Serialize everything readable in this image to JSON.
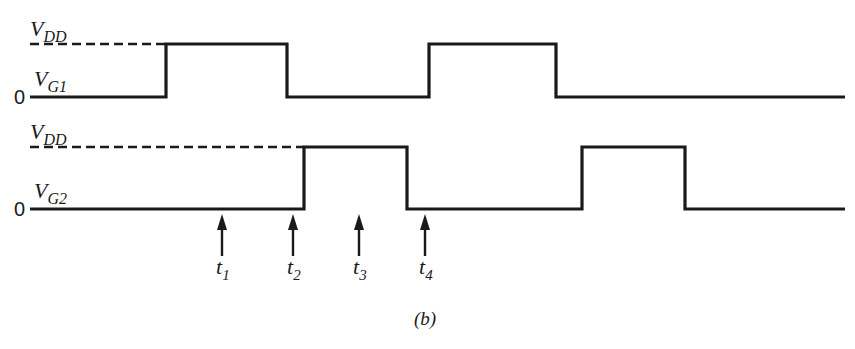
{
  "figure": {
    "caption": "(b)",
    "ink_color": "#1a1a1a",
    "background": "#ffffff"
  },
  "signals": [
    {
      "id": "vg1",
      "label_main": "V",
      "label_sub": "G1",
      "high_label_main": "V",
      "high_label_sub": "DD",
      "zero_label": "0",
      "high_y": 44,
      "low_y": 97,
      "x_start": 30,
      "x_end": 845,
      "dash_end": 166,
      "pulses": [
        [
          166,
          287
        ],
        [
          429,
          556
        ]
      ]
    },
    {
      "id": "vg2",
      "label_main": "V",
      "label_sub": "G2",
      "high_label_main": "V",
      "high_label_sub": "DD",
      "zero_label": "0",
      "high_y": 147,
      "low_y": 209,
      "x_start": 30,
      "x_end": 845,
      "dash_end": 304,
      "pulses": [
        [
          304,
          407
        ],
        [
          582,
          685
        ]
      ]
    }
  ],
  "time_markers": [
    {
      "label_main": "t",
      "label_sub": "1",
      "x": 222
    },
    {
      "label_main": "t",
      "label_sub": "2",
      "x": 293
    },
    {
      "label_main": "t",
      "label_sub": "3",
      "x": 359
    },
    {
      "label_main": "t",
      "label_sub": "4",
      "x": 425
    }
  ]
}
